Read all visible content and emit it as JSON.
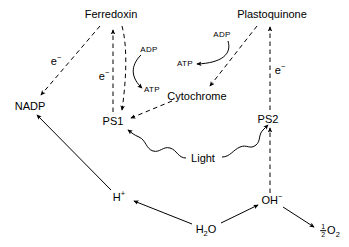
{
  "diagram": {
    "colors": {
      "stroke": "#000000",
      "background": "#ffffff"
    },
    "nodes": [
      {
        "id": "ferredoxin",
        "label": "Ferredoxin",
        "x": 111,
        "y": 14,
        "size": "main"
      },
      {
        "id": "plastoquinone",
        "label": "Plastoquinone",
        "x": 272,
        "y": 14,
        "size": "main"
      },
      {
        "id": "nadp",
        "label": "NADP",
        "x": 30,
        "y": 106,
        "size": "main"
      },
      {
        "id": "ps1",
        "label": "PS1",
        "x": 113,
        "y": 121,
        "size": "main"
      },
      {
        "id": "ps2",
        "label": "PS2",
        "x": 268,
        "y": 119,
        "size": "main"
      },
      {
        "id": "cytochrome",
        "label": "Cytochrome",
        "x": 197,
        "y": 96,
        "size": "main"
      },
      {
        "id": "light",
        "label": "Light",
        "x": 203,
        "y": 158,
        "size": "main"
      }
    ],
    "molecule_nodes": [
      {
        "id": "h-plus",
        "label_html": "H<sup>+</sup>",
        "x": 119,
        "y": 197
      },
      {
        "id": "water",
        "label_html": "H<sub>2</sub>O",
        "x": 206,
        "y": 229
      },
      {
        "id": "oh-minus",
        "label_html": "OH<sup>−</sup>",
        "x": 272,
        "y": 200
      },
      {
        "id": "oxygen",
        "label_html": "½ O<sub>2</sub>",
        "x": 330,
        "y": 231
      }
    ],
    "edge_labels": [
      {
        "id": "electron-nadp",
        "label_html": "e<sup>−</sup>",
        "x": 56,
        "y": 61
      },
      {
        "id": "electron-ferredoxin",
        "label_html": "e<sup>−</sup>",
        "x": 104,
        "y": 76
      },
      {
        "id": "electron-plastoquinone",
        "label_html": "e<sup>−</sup>",
        "x": 280,
        "y": 70
      },
      {
        "id": "adp-ferredoxin",
        "label": "ADP",
        "x": 149,
        "y": 50
      },
      {
        "id": "atp-ferredoxin",
        "label": "ATP",
        "x": 152,
        "y": 90
      },
      {
        "id": "adp-cytochrome",
        "label": "ADP",
        "x": 222,
        "y": 35
      },
      {
        "id": "atp-cytochrome",
        "label": "ATP",
        "x": 185,
        "y": 64
      }
    ],
    "edges": [
      {
        "id": "ferredoxin-to-nadp",
        "from": "ferredoxin",
        "to": "nadp",
        "style": "dashed",
        "arrow": "end"
      },
      {
        "id": "ps1-to-ferredoxin",
        "from": "ps1",
        "to": "ferredoxin",
        "style": "dashed",
        "arrow": "end"
      },
      {
        "id": "ferredoxin-branch-to-ps1",
        "from": "ferredoxin",
        "to": "ps1",
        "style": "dashed",
        "arrow": "end"
      },
      {
        "id": "cytochrome-to-ps1",
        "from": "cytochrome",
        "to": "ps1",
        "style": "dashed",
        "arrow": "end"
      },
      {
        "id": "plastoquinone-to-cytochrome",
        "from": "plastoquinone",
        "to": "cytochrome",
        "style": "dashed",
        "arrow": "end"
      },
      {
        "id": "ps2-to-plastoquinone",
        "from": "ps2",
        "to": "plastoquinone",
        "style": "dashed",
        "arrow": "end"
      },
      {
        "id": "ohminus-to-ps2",
        "from": "oh-minus",
        "to": "ps2",
        "style": "dashed",
        "arrow": "end"
      },
      {
        "id": "hplus-to-nadp",
        "from": "h-plus",
        "to": "nadp",
        "style": "solid",
        "arrow": "end"
      },
      {
        "id": "water-to-hplus",
        "from": "water",
        "to": "h-plus",
        "style": "solid",
        "arrow": "end"
      },
      {
        "id": "water-to-ohminus",
        "from": "water",
        "to": "oh-minus",
        "style": "solid",
        "arrow": "end"
      },
      {
        "id": "ohminus-to-oxygen",
        "from": "oh-minus",
        "to": "oxygen",
        "style": "solid",
        "arrow": "end"
      },
      {
        "id": "adp-to-atp-ferredoxin",
        "from": "adp-ferredoxin",
        "to": "atp-ferredoxin",
        "style": "curved",
        "arrow": "end"
      },
      {
        "id": "adp-to-atp-cytochrome",
        "from": "adp-cytochrome",
        "to": "atp-cytochrome",
        "style": "curved",
        "arrow": "end"
      },
      {
        "id": "light-to-ps1",
        "from": "light",
        "to": "ps1",
        "style": "wavy",
        "arrow": "end"
      },
      {
        "id": "light-to-ps2",
        "from": "light",
        "to": "ps2",
        "style": "wavy",
        "arrow": "end"
      }
    ]
  }
}
